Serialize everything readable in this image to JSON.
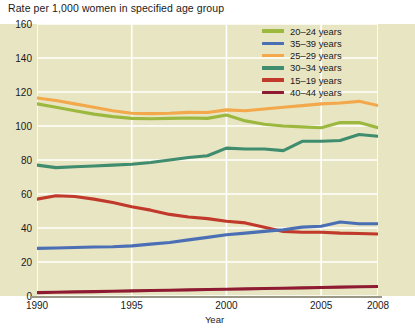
{
  "title": "Rate per 1,000 women in specified age group",
  "axis": {
    "x_title": "Year",
    "y_ticks": [
      "0",
      "20",
      "40",
      "60",
      "80",
      "100",
      "120",
      "140",
      "160"
    ],
    "x_ticks": [
      "1990",
      "1995",
      "2000",
      "2005",
      "2008"
    ]
  },
  "legend": [
    {
      "label": "20–24 years",
      "color": "#9cb83f"
    },
    {
      "label": "35–39 years",
      "color": "#4a6fb5"
    },
    {
      "label": "25–29 years",
      "color": "#f2a84b"
    },
    {
      "label": "30–34 years",
      "color": "#3f8d6e"
    },
    {
      "label": "15–19 years",
      "color": "#c0392b"
    },
    {
      "label": "40–44 years",
      "color": "#8f1b33"
    }
  ],
  "colors": {
    "plot_background": "#e8e5c2",
    "gridline": "#ffffff",
    "axis_line": "#9a9784",
    "text": "#1a1a1a"
  },
  "chart_data": {
    "type": "line",
    "title": "Rate per 1,000 women in specified age group",
    "xlabel": "Year",
    "ylabel": "Rate per 1,000 women in specified age group",
    "xlim": [
      1990,
      2008
    ],
    "ylim": [
      0,
      160
    ],
    "ytick_step": 20,
    "grid": true,
    "legend_position": "top-right",
    "x": [
      1990,
      1991,
      1992,
      1993,
      1994,
      1995,
      1996,
      1997,
      1998,
      1999,
      2000,
      2001,
      2002,
      2003,
      2004,
      2005,
      2006,
      2007,
      2008
    ],
    "series": [
      {
        "name": "25–29 years",
        "color": "#f2a84b",
        "values": [
          116.5,
          115.0,
          113.0,
          111.0,
          109.0,
          107.5,
          107.3,
          107.5,
          108.0,
          107.9,
          109.5,
          109.0,
          110.0,
          111.0,
          112.0,
          113.0,
          113.5,
          114.5,
          112.0
        ]
      },
      {
        "name": "20–24 years",
        "color": "#9cb83f",
        "values": [
          113.0,
          111.0,
          109.0,
          107.0,
          105.5,
          104.5,
          104.3,
          104.5,
          104.7,
          104.5,
          106.5,
          103.0,
          101.0,
          100.0,
          99.5,
          99.0,
          102.0,
          102.0,
          99.0
        ]
      },
      {
        "name": "30–34 years",
        "color": "#3f8d6e",
        "values": [
          77.0,
          75.5,
          76.0,
          76.5,
          77.0,
          77.5,
          78.5,
          80.0,
          81.5,
          82.5,
          87.0,
          86.5,
          86.5,
          85.5,
          91.0,
          91.0,
          91.5,
          95.0,
          94.0
        ]
      },
      {
        "name": "15–19 years",
        "color": "#c0392b",
        "values": [
          57.0,
          59.0,
          58.5,
          57.0,
          55.0,
          52.5,
          50.5,
          48.0,
          46.5,
          45.5,
          44.0,
          43.0,
          40.5,
          38.0,
          37.5,
          37.5,
          37.0,
          36.8,
          36.5
        ]
      },
      {
        "name": "35–39 years",
        "color": "#4a6fb5",
        "values": [
          28.0,
          28.2,
          28.5,
          28.8,
          29.0,
          29.5,
          30.5,
          31.5,
          33.0,
          34.5,
          36.0,
          37.0,
          38.0,
          39.0,
          40.5,
          41.0,
          43.5,
          42.5,
          42.5
        ]
      },
      {
        "name": "40–44 years",
        "color": "#8f1b33",
        "values": [
          2.0,
          2.2,
          2.4,
          2.6,
          2.8,
          3.0,
          3.2,
          3.4,
          3.6,
          3.8,
          4.0,
          4.2,
          4.4,
          4.6,
          4.8,
          5.0,
          5.2,
          5.4,
          5.6
        ]
      }
    ]
  }
}
